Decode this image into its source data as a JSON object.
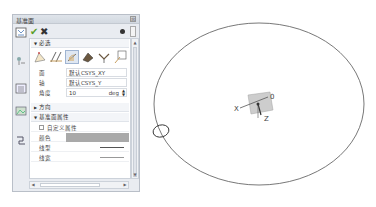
{
  "dialog": {
    "title": "基准面",
    "close_glyph": "⊠",
    "ok_glyph": "✔",
    "cancel_glyph": "✖",
    "sections": {
      "required": {
        "label": "必选",
        "expanded": true
      },
      "direction": {
        "label": "方向",
        "expanded": false
      },
      "properties": {
        "label": "基准面属性",
        "expanded": true
      }
    },
    "type_icons": [
      "plane-by-points",
      "plane-by-lines",
      "plane-by-angle",
      "plane-offset",
      "plane-normal",
      "plane-tangent"
    ],
    "active_type_index": 2,
    "fields": {
      "plane": {
        "label": "面",
        "value": "默认CSYS_XY"
      },
      "axis": {
        "label": "轴",
        "value": "默认CSYS_Y"
      },
      "angle": {
        "label": "角度",
        "value": "10",
        "unit": "deg"
      }
    },
    "properties": {
      "custom": {
        "label": "自定义属性",
        "checked": false
      },
      "color": {
        "label": "颜色",
        "value_color": "#a9a9a9"
      },
      "line_type": {
        "label": "线型"
      },
      "line_width": {
        "label": "线宽"
      }
    }
  },
  "viewport": {
    "axis_labels": {
      "x": "X",
      "z": "Z",
      "marker": "0"
    },
    "colors": {
      "ellipse": "#555555",
      "plane": "#b8b8b8"
    }
  }
}
